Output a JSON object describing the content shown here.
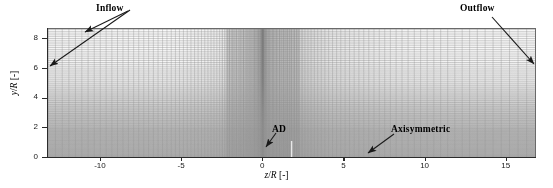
{
  "figure": {
    "kind": "computational-mesh-plot",
    "background": "#ffffff"
  },
  "chart_data": {
    "type": "heatmap",
    "title": "",
    "subtitle": "",
    "xlabel": "z/R [-]",
    "ylabel": "y/R [-]",
    "xlim": [
      -13.2,
      16.8
    ],
    "ylim": [
      0,
      8.6
    ],
    "xticks": [
      -10,
      -5,
      0,
      5,
      10,
      15
    ],
    "xticklabels": [
      "-10",
      "-5",
      "0",
      "5",
      "10",
      "15"
    ],
    "yticks": [
      0,
      2,
      4,
      6,
      8
    ],
    "yticklabels": [
      "0",
      "2",
      "4",
      "6",
      "8"
    ],
    "grid": true,
    "legend": "none",
    "mesh": {
      "refinement_center_x": 0,
      "x_cluster_half_width": 2.5,
      "y_cluster_extent": 2.0,
      "n_vertical_lines": 150,
      "n_horizontal_lines": 74,
      "line_color": "#8c8c8c"
    },
    "annotations": [
      {
        "label": "Inflow",
        "target": "left and top domain boundaries",
        "arrows": 2
      },
      {
        "label": "Outflow",
        "target": "right domain boundary",
        "arrows": 1
      },
      {
        "label": "AD",
        "target": "actuator disk at z/R = 0",
        "arrows": 1
      },
      {
        "label": "Axisymmetric",
        "target": "bottom boundary, axis of symmetry",
        "arrows": 1
      }
    ]
  },
  "axes": {
    "x_title": "z/R [-]",
    "x_title_var": "z",
    "x_title_var2": "R",
    "x_title_unit": " [-]",
    "y_title_var": "y",
    "y_title_var2": "R",
    "y_title_unit": " [-]",
    "xticklabels": [
      "-10",
      "-5",
      "0",
      "5",
      "10",
      "15"
    ],
    "yticklabels": [
      "0",
      "2",
      "4",
      "6",
      "8"
    ]
  },
  "annotations": {
    "inflow": "Inflow",
    "outflow": "Outflow",
    "ad": "AD",
    "axisymmetric": "Axisymmetric"
  },
  "colors": {
    "mesh_line": "#8c8c8c",
    "axis": "#2b2b2b",
    "text": "#000000",
    "shade": "#969696",
    "arrow": "#1a1a1a"
  }
}
